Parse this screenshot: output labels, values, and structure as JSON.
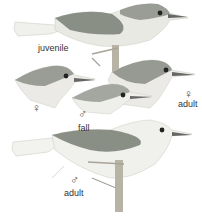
{
  "plate": {
    "description": "Field guide illustration plate of a small grey-backed songbird in several plumages",
    "colors": {
      "back": "#8a8f86",
      "head": "#9a9d96",
      "underparts": "#eeeeea",
      "tail": "#f2f2ee",
      "legs": "#b9b3a6",
      "label": "#333333"
    },
    "figures": [
      {
        "id": "juvenile",
        "label": "juvenile",
        "symbol": ""
      },
      {
        "id": "female-head-left",
        "label": "",
        "symbol": "♀"
      },
      {
        "id": "fall-male-head",
        "label": "fall",
        "symbol": "♂"
      },
      {
        "id": "adult-female-head",
        "label": "adult",
        "symbol": "♀"
      },
      {
        "id": "adult-male",
        "label": "adult",
        "symbol": "♂"
      }
    ]
  }
}
